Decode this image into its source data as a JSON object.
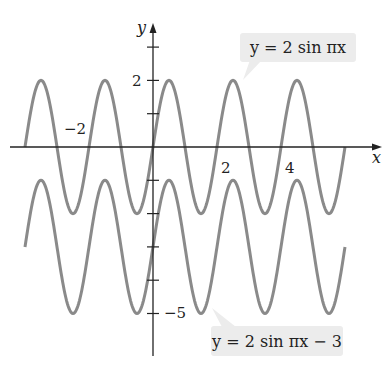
{
  "chart_data": {
    "type": "line",
    "title": "",
    "xlabel": "x",
    "ylabel": "y",
    "x_ticks_labeled": [
      -2,
      2,
      4
    ],
    "y_ticks_labeled": [
      2,
      -5
    ],
    "y_ticks": [
      3,
      2,
      1,
      -1,
      -2,
      -3,
      -4,
      -5
    ],
    "xlim": [
      -4.5,
      6.5
    ],
    "ylim": [
      -6.5,
      3.5
    ],
    "grid": false,
    "series": [
      {
        "name": "y = 2 sin πx",
        "function": "2*sin(pi*x)",
        "x_range": [
          -4,
          6
        ],
        "color": "#8a8a8a"
      },
      {
        "name": "y = 2 sin πx − 3",
        "function": "2*sin(pi*x)-3",
        "x_range": [
          -4,
          6
        ],
        "color": "#8a8a8a"
      }
    ],
    "annotations": [
      {
        "text": "y = 2 sin πx",
        "points_to_x": 2.5
      },
      {
        "text": "y = 2 sin πx − 3",
        "points_to_x": 1.5
      }
    ]
  },
  "labels": {
    "x_axis": "x",
    "y_axis": "y",
    "tick_neg2": "−2",
    "tick_2x": "2",
    "tick_4x": "4",
    "tick_2y": "2",
    "tick_neg5": "−5",
    "curve1": "y = 2 sin πx",
    "curve2": "y = 2 sin πx − 3"
  }
}
